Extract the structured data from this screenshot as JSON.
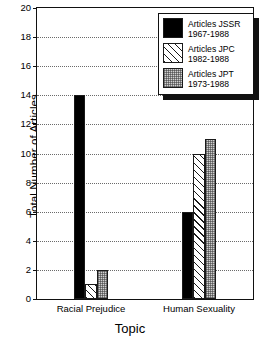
{
  "chart_data": {
    "type": "bar",
    "title": "",
    "xlabel": "Topic",
    "ylabel": "Total Number of Articles",
    "categories": [
      "Racial Prejudice",
      "Human Sexuality"
    ],
    "series": [
      {
        "name": "Articles JSSR",
        "period": "1967-1988",
        "fill": "solid",
        "color": "#000000",
        "values": [
          14,
          6
        ]
      },
      {
        "name": "Articles JPC",
        "period": "1982-1988",
        "fill": "hatch",
        "color": "#ffffff",
        "values": [
          1,
          10
        ]
      },
      {
        "name": "Articles JPT",
        "period": "1973-1988",
        "fill": "dots",
        "color": "#d0d0d0",
        "values": [
          2,
          11
        ]
      }
    ],
    "ylim": [
      0,
      20
    ],
    "yticks": [
      0,
      2,
      4,
      6,
      8,
      10,
      12,
      14,
      16,
      18,
      20
    ],
    "grid": true,
    "legend_position": "top-right"
  },
  "legend": {
    "entries": [
      {
        "label": "Articles JSSR",
        "period": "1967-1988"
      },
      {
        "label": "Articles JPC",
        "period": "1982-1988"
      },
      {
        "label": "Articles JPT",
        "period": "1973-1988"
      }
    ]
  }
}
